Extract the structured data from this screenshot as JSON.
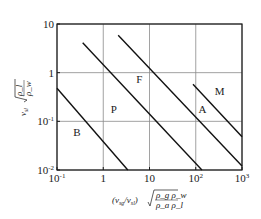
{
  "chart_data": {
    "type": "line",
    "title": "",
    "xscale": "log",
    "yscale": "log",
    "xlim": [
      0.1,
      1000
    ],
    "ylim": [
      0.01,
      10
    ],
    "grid": true,
    "x_ticks": [
      {
        "value": 0.1,
        "label": "10",
        "sup": "-1"
      },
      {
        "value": 1,
        "label": "1",
        "sup": ""
      },
      {
        "value": 10,
        "label": "10",
        "sup": ""
      },
      {
        "value": 100,
        "label": "10",
        "sup": "2"
      },
      {
        "value": 1000,
        "label": "10",
        "sup": "3"
      }
    ],
    "y_ticks": [
      {
        "value": 10,
        "label": "10",
        "sup": ""
      },
      {
        "value": 1,
        "label": "1",
        "sup": ""
      },
      {
        "value": 0.1,
        "label": "10",
        "sup": "-1"
      },
      {
        "value": 0.01,
        "label": "10",
        "sup": "-2"
      }
    ],
    "xlabel": "(v_sg/v_sl) √(ρ_g ρ_w / ρ_a ρ_l)",
    "xlabel_parts": {
      "prefix": "(v",
      "sub1": "sg",
      "mid": "/v",
      "sub2": "sl",
      "close": ")",
      "num": "ρ_g ρ_w",
      "den": "ρ_a ρ_l"
    },
    "ylabel": "v_sl √(ρ_l / ρ_w)",
    "ylabel_parts": {
      "v": "v",
      "sub": "sl",
      "num": "ρ_l",
      "den": "ρ_w"
    },
    "series": [
      {
        "name": "B-P boundary",
        "points": [
          [
            0.1,
            0.48
          ],
          [
            3.4,
            0.01
          ]
        ]
      },
      {
        "name": "P-F boundary",
        "points": [
          [
            0.36,
            4.1
          ],
          [
            136,
            0.01
          ]
        ]
      },
      {
        "name": "F-A boundary",
        "points": [
          [
            2.1,
            5.9
          ],
          [
            1000,
            0.012
          ]
        ]
      },
      {
        "name": "A-M boundary",
        "points": [
          [
            87,
            0.58
          ],
          [
            1000,
            0.048
          ]
        ]
      }
    ],
    "regions": [
      {
        "label": "B",
        "x": 0.27,
        "y": 0.05
      },
      {
        "label": "P",
        "x": 1.7,
        "y": 0.15
      },
      {
        "label": "F",
        "x": 6.0,
        "y": 0.6
      },
      {
        "label": "A",
        "x": 140,
        "y": 0.15
      },
      {
        "label": "M",
        "x": 330,
        "y": 0.35
      }
    ]
  }
}
